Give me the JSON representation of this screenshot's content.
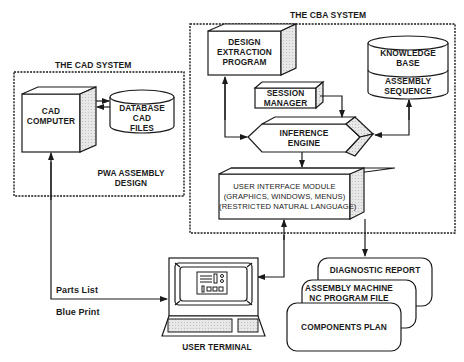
{
  "diagram": {
    "cad_system": {
      "title": "THE CAD SYSTEM",
      "cad_computer": {
        "line1": "CAD",
        "line2": "COMPUTER"
      },
      "database": {
        "line1": "DATABASE",
        "line2": "CAD",
        "line3": "FILES"
      },
      "caption": {
        "line1": "PWA ASSEMBLY",
        "line2": "DESIGN"
      }
    },
    "cba_system": {
      "title": "THE CBA SYSTEM",
      "design_extraction": {
        "line1": "DESIGN",
        "line2": "EXTRACTION",
        "line3": "PROGRAM"
      },
      "knowledge_base": {
        "line1": "KNOWLEDGE",
        "line2": "BASE",
        "line3": "ASSEMBLY",
        "line4": "SEQUENCE"
      },
      "session_manager": {
        "line1": "SESSION",
        "line2": "MANAGER"
      },
      "inference_engine": {
        "line1": "INFERENCE",
        "line2": "ENGINE"
      },
      "user_interface": {
        "line1": "USER INTERFACE MODULE",
        "line2": "(GRAPHICS, WINDOWS, MENUS)",
        "line3": "(RESTRICTED NATURAL LANGUAGE)"
      }
    },
    "user_terminal": {
      "label": "USER TERMINAL"
    },
    "connections": {
      "parts_list": "Parts List",
      "blue_print": "Blue Print"
    },
    "outputs": {
      "diagnostic_report": "DIAGNOSTIC REPORT",
      "nc_program": {
        "line1": "ASSEMBLY MACHINE",
        "line2": "NC PROGRAM FILE"
      },
      "components_plan": "COMPONENTS PLAN"
    },
    "colors": {
      "ink": "#1a1a1a",
      "background": "#ffffff",
      "shade": "#d8d8d8"
    }
  }
}
